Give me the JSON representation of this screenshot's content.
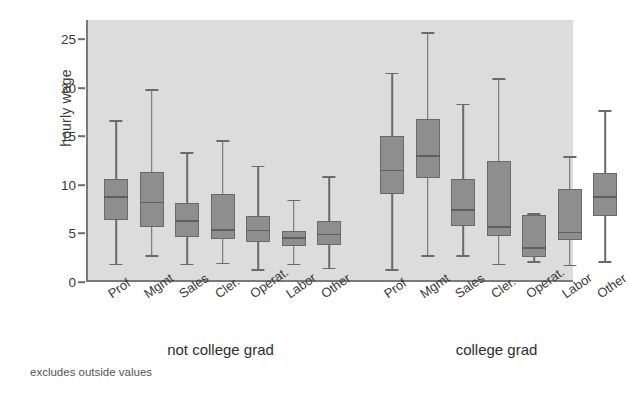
{
  "chart_data": {
    "type": "box",
    "title": "",
    "xlabel": "",
    "ylabel": "hourly wage",
    "ylim": [
      0,
      27
    ],
    "yticks": [
      0,
      5,
      10,
      15,
      20,
      25
    ],
    "ytick_labels": [
      "0",
      "5",
      "10",
      "15",
      "20",
      "25"
    ],
    "grid": false,
    "legend": "none",
    "note": "excludes outside values",
    "plot_bg": "#dcdcdc",
    "box_fill": "#8e8e8e",
    "box_edge": "#6a6a6a",
    "groups": [
      {
        "label": "not college grad",
        "categories": [
          "Prof",
          "Mgmt",
          "Sales",
          "Cler.",
          "Operat.",
          "Labor",
          "Other"
        ],
        "boxes": [
          {
            "category": "Prof",
            "lower_whisker": 1.5,
            "q1": 6.2,
            "median": 8.5,
            "q3": 10.4,
            "upper_whisker": 16.3
          },
          {
            "category": "Mgmt",
            "lower_whisker": 2.4,
            "q1": 5.5,
            "median": 7.9,
            "q3": 11.1,
            "upper_whisker": 19.5
          },
          {
            "category": "Sales",
            "lower_whisker": 1.5,
            "q1": 4.4,
            "median": 6.0,
            "q3": 7.9,
            "upper_whisker": 13.0
          },
          {
            "category": "Cler.",
            "lower_whisker": 1.6,
            "q1": 4.2,
            "median": 5.1,
            "q3": 8.9,
            "upper_whisker": 14.2
          },
          {
            "category": "Operat.",
            "lower_whisker": 0.9,
            "q1": 3.9,
            "median": 5.0,
            "q3": 6.6,
            "upper_whisker": 11.6
          },
          {
            "category": "Labor",
            "lower_whisker": 1.5,
            "q1": 3.5,
            "median": 4.2,
            "q3": 5.1,
            "upper_whisker": 8.1
          },
          {
            "category": "Other",
            "lower_whisker": 1.1,
            "q1": 3.6,
            "median": 4.6,
            "q3": 6.1,
            "upper_whisker": 10.5
          }
        ]
      },
      {
        "label": "college grad",
        "categories": [
          "Prof",
          "Mgmt",
          "Sales",
          "Cler.",
          "Operat.",
          "Labor",
          "Other"
        ],
        "boxes": [
          {
            "category": "Prof",
            "lower_whisker": 0.9,
            "q1": 8.9,
            "median": 11.2,
            "q3": 14.8,
            "upper_whisker": 21.2
          },
          {
            "category": "Mgmt",
            "lower_whisker": 2.4,
            "q1": 10.5,
            "median": 12.7,
            "q3": 16.6,
            "upper_whisker": 25.4
          },
          {
            "category": "Sales",
            "lower_whisker": 2.4,
            "q1": 5.6,
            "median": 7.1,
            "q3": 10.4,
            "upper_whisker": 18.0
          },
          {
            "category": "Cler.",
            "lower_whisker": 1.5,
            "q1": 4.5,
            "median": 5.4,
            "q3": 12.3,
            "upper_whisker": 20.6
          },
          {
            "category": "Operat.",
            "lower_whisker": 1.8,
            "q1": 2.4,
            "median": 3.2,
            "q3": 6.7,
            "upper_whisker": 6.7
          },
          {
            "category": "Labor",
            "lower_whisker": 1.4,
            "q1": 4.1,
            "median": 4.8,
            "q3": 9.4,
            "upper_whisker": 12.6
          },
          {
            "category": "Other",
            "lower_whisker": 1.8,
            "q1": 6.6,
            "median": 8.5,
            "q3": 11.0,
            "upper_whisker": 17.3
          }
        ]
      }
    ]
  }
}
